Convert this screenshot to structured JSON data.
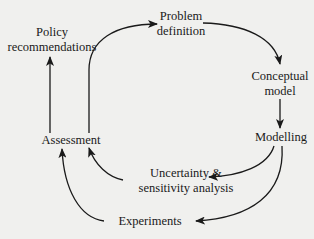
{
  "diagram": {
    "type": "cycle-flow",
    "nodes": {
      "policy": {
        "line1": "Policy",
        "line2": "recommendations"
      },
      "problem": {
        "line1": "Problem",
        "line2": "definition"
      },
      "conceptual": {
        "line1": "Conceptual",
        "line2": "model"
      },
      "modelling": {
        "line1": "Modelling"
      },
      "assessment": {
        "line1": "Assessment"
      },
      "uncertainty": {
        "line1": "Uncertainty &",
        "line2": "sensitivity analysis"
      },
      "experiments": {
        "line1": "Experiments"
      }
    },
    "edges": [
      {
        "from": "Assessment",
        "to": "Policy recommendations"
      },
      {
        "from": "Assessment",
        "to": "Problem definition"
      },
      {
        "from": "Problem definition",
        "to": "Conceptual model"
      },
      {
        "from": "Conceptual model",
        "to": "Modelling"
      },
      {
        "from": "Modelling",
        "to": "Uncertainty & sensitivity analysis"
      },
      {
        "from": "Modelling",
        "to": "Experiments"
      },
      {
        "from": "Uncertainty & sensitivity analysis",
        "to": "Assessment"
      },
      {
        "from": "Experiments",
        "to": "Assessment"
      }
    ],
    "colors": {
      "background": "#f0f0ee",
      "ink": "#1a1a1a"
    }
  }
}
